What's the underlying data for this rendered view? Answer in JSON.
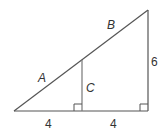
{
  "diagram": {
    "type": "similar right triangles",
    "labels": {
      "hypotenuse_lower": "A",
      "hypotenuse_upper": "B",
      "inner_vertical": "C",
      "outer_vertical": "6",
      "base_left": "4",
      "base_right": "4"
    },
    "colors": {
      "line": "#555555",
      "text": "#333333"
    }
  }
}
